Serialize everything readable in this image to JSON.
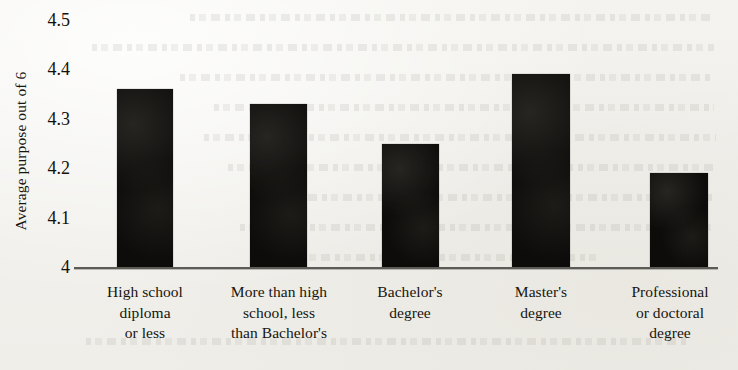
{
  "chart_data": {
    "type": "bar",
    "title": "",
    "xlabel": "",
    "ylabel": "Average purpose out of 6",
    "categories": [
      "High school diploma or less",
      "More than high school, less than Bachelor's",
      "Bachelor's degree",
      "Master's degree",
      "Professional or doctoral degree"
    ],
    "category_lines": [
      [
        "High school",
        "diploma",
        "or less"
      ],
      [
        "More than high",
        "school, less",
        "than Bachelor's"
      ],
      [
        "Bachelor's",
        "degree"
      ],
      [
        "Master's",
        "degree"
      ],
      [
        "Professional",
        "or doctoral",
        "degree"
      ]
    ],
    "values": [
      4.36,
      4.33,
      4.25,
      4.39,
      4.19
    ],
    "ylim": [
      4,
      4.5
    ],
    "yticks": [
      "4.5",
      "4.4",
      "4.3",
      "4.2",
      "4.1",
      "4"
    ],
    "ytick_values": [
      4.5,
      4.4,
      4.3,
      4.2,
      4.1,
      4.0
    ],
    "grid": false,
    "legend": null,
    "bar_color": "#0d0c0a",
    "axis_color": "#5d5b55",
    "background_color": "#f1f0ec"
  },
  "axis": {
    "y_title": "Average purpose out of 6"
  }
}
